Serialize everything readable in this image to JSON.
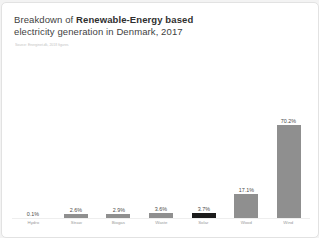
{
  "card": {
    "title": {
      "prefix": "Breakdown of ",
      "bold": "Renewable-Energy based",
      "line2": "electricity generation in Denmark, 2017"
    },
    "source_note": "Source: Energinet.dk, 2018 figures"
  },
  "chart_data": {
    "type": "bar",
    "categories": [
      "Hydro",
      "Straw",
      "Biogas",
      "Waste",
      "Solar",
      "Wood",
      "Wind"
    ],
    "values": [
      0.1,
      2.6,
      2.9,
      3.6,
      3.7,
      17.1,
      70.2
    ],
    "unit": "%",
    "xlabel": "",
    "ylabel": "",
    "ylim": [
      0,
      75
    ],
    "grid": false,
    "legend": false,
    "bar_color": "#8f8f8f",
    "highlight": {
      "category": "Solar",
      "color": "#1b1b1b"
    },
    "value_labels": [
      "0.1%",
      "2.6%",
      "2.9%",
      "3.6%",
      "3.7%",
      "17.1%",
      "70.2%"
    ]
  }
}
